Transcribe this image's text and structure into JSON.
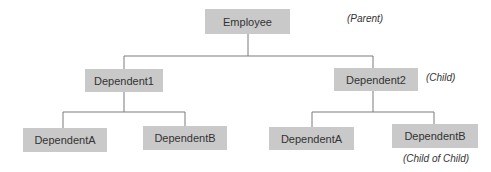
{
  "diagram": {
    "type": "hierarchy-tree",
    "colors": {
      "node_fill": "#c9c9c9",
      "node_text": "#333333",
      "connector": "#7a7a7a"
    },
    "nodes": {
      "root": {
        "label": "Employee",
        "annotation": "(Parent)"
      },
      "child1": {
        "label": "Dependent1"
      },
      "child2": {
        "label": "Dependent2",
        "annotation": "(Child)"
      },
      "grand1a": {
        "label": "DependentA"
      },
      "grand1b": {
        "label": "DependentB"
      },
      "grand2a": {
        "label": "DependentA"
      },
      "grand2b": {
        "label": "DependentB",
        "annotation": "(Child of Child)"
      }
    },
    "edges": [
      [
        "Employee",
        "Dependent1"
      ],
      [
        "Employee",
        "Dependent2"
      ],
      [
        "Dependent1",
        "DependentA"
      ],
      [
        "Dependent1",
        "DependentB"
      ],
      [
        "Dependent2",
        "DependentA"
      ],
      [
        "Dependent2",
        "DependentB"
      ]
    ]
  }
}
